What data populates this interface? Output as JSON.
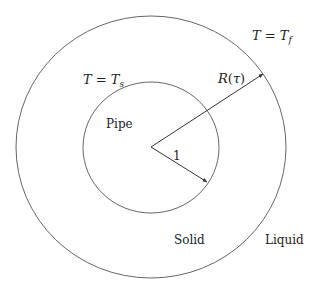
{
  "diagram": {
    "colors": {
      "stroke": "#555555",
      "text": "#222222",
      "background": "#ffffff"
    },
    "regions": {
      "pipe": "Pipe",
      "solid": "Solid",
      "liquid": "Liquid"
    },
    "conditions": {
      "inner": {
        "lhs": "T",
        "eq": " = ",
        "rhs": "T",
        "sub": "s"
      },
      "outer": {
        "lhs": "T",
        "eq": " = ",
        "rhs": "T",
        "sub": "f"
      }
    },
    "radii": {
      "inner_label": "1",
      "outer_label": {
        "name": "R",
        "open": "(",
        "arg": "τ",
        "close": ")"
      }
    }
  }
}
